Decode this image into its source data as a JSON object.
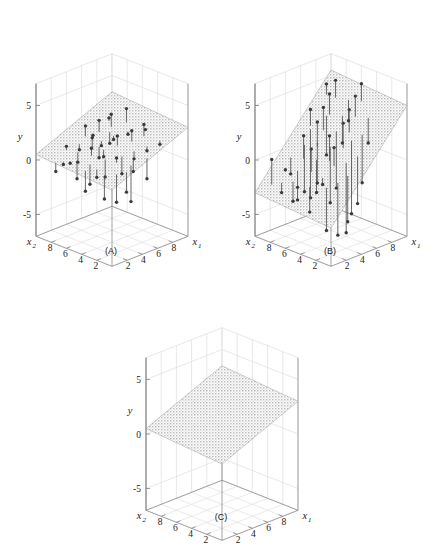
{
  "figure": {
    "type": "multi-panel-3d-regression",
    "panel_count": 3,
    "background": "#ffffff",
    "line_color": "#4d4d4d",
    "point_color": "#3a3a3a",
    "grid_color": "#d8d8d8",
    "axis_color": "#808080",
    "plane_fill": "#b9b9b9"
  },
  "axes": {
    "y_title": "y",
    "x1_title": "x",
    "x1_sub": "1",
    "x2_title": "x",
    "x2_sub": "2",
    "y_ticks": [
      "5",
      "0",
      "-5"
    ],
    "y_tick_values": [
      5,
      0,
      -5
    ],
    "x1_ticks": [
      "2",
      "4",
      "6",
      "8"
    ],
    "x1_tick_values": [
      2,
      4,
      6,
      8
    ],
    "x2_ticks": [
      "8",
      "6",
      "4",
      "2"
    ],
    "x2_tick_values": [
      8,
      6,
      4,
      2
    ],
    "y_range": [
      -7,
      7
    ],
    "x1_range": [
      0,
      10
    ],
    "x2_range": [
      0,
      10
    ]
  },
  "panels": [
    {
      "id": "A",
      "caption": "(A)",
      "description": "fitted plane with small residuals",
      "has_points": true,
      "plane_tilt": "shallow",
      "residual_scale": "short"
    },
    {
      "id": "B",
      "caption": "(B)",
      "description": "steeply tilted plane with large residuals",
      "has_points": true,
      "plane_tilt": "steep",
      "residual_scale": "long"
    },
    {
      "id": "C",
      "caption": "(C)",
      "description": "plane only, no data points",
      "has_points": false,
      "plane_tilt": "shallow",
      "residual_scale": "none"
    }
  ],
  "chart_data": {
    "type": "scatter",
    "title": "",
    "xlabel": "x1",
    "ylabel": "y",
    "zlabel": "x2",
    "grid": true,
    "legend": "none",
    "axis_ranges": {
      "x1": [
        0,
        10
      ],
      "x2": [
        0,
        10
      ],
      "y": [
        -7,
        7
      ]
    },
    "panels": [
      {
        "id": "A",
        "plane": {
          "intercept": 0.0,
          "slope_x1": 0.3,
          "slope_x2": 0.05
        },
        "points": [
          {
            "x1": 1.2,
            "x2": 8.6,
            "y": -1.0,
            "fit": -0.2
          },
          {
            "x1": 1.6,
            "x2": 8.0,
            "y": -0.3,
            "fit": -0.1
          },
          {
            "x1": 1.9,
            "x2": 7.4,
            "y": -0.1,
            "fit": 0.05
          },
          {
            "x1": 2.3,
            "x2": 6.9,
            "y": -1.5,
            "fit": 0.15
          },
          {
            "x1": 2.6,
            "x2": 5.5,
            "y": -1.7,
            "fit": 0.1
          },
          {
            "x1": 3.0,
            "x2": 9.0,
            "y": 0.7,
            "fit": 0.35
          },
          {
            "x1": 3.3,
            "x2": 7.8,
            "y": -0.5,
            "fit": 0.4
          },
          {
            "x1": 3.6,
            "x2": 6.3,
            "y": 1.1,
            "fit": 0.42
          },
          {
            "x1": 3.9,
            "x2": 4.8,
            "y": -1.2,
            "fit": 0.4
          },
          {
            "x1": 4.2,
            "x2": 8.5,
            "y": 0.2,
            "fit": 0.7
          },
          {
            "x1": 4.5,
            "x2": 7.1,
            "y": 1.6,
            "fit": 0.72
          },
          {
            "x1": 4.8,
            "x2": 5.9,
            "y": 0.1,
            "fit": 0.74
          },
          {
            "x1": 5.0,
            "x2": 3.7,
            "y": -0.9,
            "fit": 0.68
          },
          {
            "x1": 5.3,
            "x2": 8.8,
            "y": 2.0,
            "fit": 1.03
          },
          {
            "x1": 5.6,
            "x2": 7.0,
            "y": 0.6,
            "fit": 1.03
          },
          {
            "x1": 5.9,
            "x2": 5.2,
            "y": 1.9,
            "fit": 1.03
          },
          {
            "x1": 6.1,
            "x2": 3.2,
            "y": 0.3,
            "fit": 0.99
          },
          {
            "x1": 6.4,
            "x2": 8.1,
            "y": 2.4,
            "fit": 1.33
          },
          {
            "x1": 6.7,
            "x2": 6.5,
            "y": 1.0,
            "fit": 1.34
          },
          {
            "x1": 7.0,
            "x2": 4.4,
            "y": 2.3,
            "fit": 1.32
          },
          {
            "x1": 7.2,
            "x2": 2.6,
            "y": 0.9,
            "fit": 1.29
          },
          {
            "x1": 7.5,
            "x2": 7.6,
            "y": 2.8,
            "fit": 1.63
          },
          {
            "x1": 7.8,
            "x2": 5.7,
            "y": 1.4,
            "fit": 1.63
          },
          {
            "x1": 8.1,
            "x2": 3.9,
            "y": 2.7,
            "fit": 1.63
          },
          {
            "x1": 8.4,
            "x2": 2.1,
            "y": 1.3,
            "fit": 1.62
          },
          {
            "x1": 8.7,
            "x2": 6.8,
            "y": 3.2,
            "fit": 1.95
          },
          {
            "x1": 9.0,
            "x2": 4.6,
            "y": 1.8,
            "fit": 1.93
          },
          {
            "x1": 2.0,
            "x2": 3.0,
            "y": -2.2,
            "fit": -0.15
          },
          {
            "x1": 2.8,
            "x2": 2.2,
            "y": -2.5,
            "fit": 0.05
          },
          {
            "x1": 3.5,
            "x2": 1.6,
            "y": -1.6,
            "fit": 0.23
          },
          {
            "x1": 4.4,
            "x2": 1.9,
            "y": -2.8,
            "fit": 0.51
          },
          {
            "x1": 5.2,
            "x2": 2.4,
            "y": -0.4,
            "fit": 0.68
          },
          {
            "x1": 6.0,
            "x2": 1.4,
            "y": -1.0,
            "fit": 0.87
          },
          {
            "x1": 1.5,
            "x2": 5.0,
            "y": -1.9,
            "fit": -0.05
          },
          {
            "x1": 2.2,
            "x2": 4.2,
            "y": -0.6,
            "fit": 0.12
          },
          {
            "x1": 4.0,
            "x2": 3.4,
            "y": 0.9,
            "fit": 0.47
          },
          {
            "x1": 4.9,
            "x2": 6.6,
            "y": -0.2,
            "fit": 0.8
          },
          {
            "x1": 5.7,
            "x2": 8.2,
            "y": 1.2,
            "fit": 1.12
          },
          {
            "x1": 6.9,
            "x2": 7.2,
            "y": 0.4,
            "fit": 1.43
          },
          {
            "x1": 8.0,
            "x2": 8.4,
            "y": 2.1,
            "fit": 1.82
          }
        ]
      },
      {
        "id": "B",
        "plane": {
          "intercept": -3.5,
          "slope_x1": 0.85,
          "slope_x2": 0.05
        },
        "points": [
          {
            "x1": 1.0,
            "x2": 8.8,
            "y": 0.1,
            "fit": -2.2
          },
          {
            "x1": 1.4,
            "x2": 7.9,
            "y": -2.8,
            "fit": -1.9
          },
          {
            "x1": 1.8,
            "x2": 6.8,
            "y": -3.4,
            "fit": -1.6
          },
          {
            "x1": 2.2,
            "x2": 8.2,
            "y": -1.0,
            "fit": -1.2
          },
          {
            "x1": 2.6,
            "x2": 7.0,
            "y": -2.4,
            "fit": -0.9
          },
          {
            "x1": 3.0,
            "x2": 5.6,
            "y": 1.4,
            "fit": -0.7
          },
          {
            "x1": 3.3,
            "x2": 8.6,
            "y": -1.8,
            "fit": -0.3
          },
          {
            "x1": 3.6,
            "x2": 7.2,
            "y": 2.0,
            "fit": -0.1
          },
          {
            "x1": 3.9,
            "x2": 5.8,
            "y": -2.9,
            "fit": 0.1
          },
          {
            "x1": 4.2,
            "x2": 4.4,
            "y": 2.6,
            "fit": 0.3
          },
          {
            "x1": 4.5,
            "x2": 8.0,
            "y": -3.6,
            "fit": 0.7
          },
          {
            "x1": 4.8,
            "x2": 6.6,
            "y": 3.1,
            "fit": 0.9
          },
          {
            "x1": 5.1,
            "x2": 5.2,
            "y": -4.0,
            "fit": 1.1
          },
          {
            "x1": 5.4,
            "x2": 3.8,
            "y": 3.6,
            "fit": 1.3
          },
          {
            "x1": 5.7,
            "x2": 8.4,
            "y": -4.6,
            "fit": 1.7
          },
          {
            "x1": 6.0,
            "x2": 7.0,
            "y": 4.0,
            "fit": 1.9
          },
          {
            "x1": 6.3,
            "x2": 5.6,
            "y": -3.1,
            "fit": 2.1
          },
          {
            "x1": 6.6,
            "x2": 4.2,
            "y": 4.4,
            "fit": 2.3
          },
          {
            "x1": 6.9,
            "x2": 2.8,
            "y": -2.0,
            "fit": 2.4
          },
          {
            "x1": 7.2,
            "x2": 7.4,
            "y": 4.8,
            "fit": 2.9
          },
          {
            "x1": 7.5,
            "x2": 6.0,
            "y": 0.6,
            "fit": 3.1
          },
          {
            "x1": 7.8,
            "x2": 4.6,
            "y": 5.2,
            "fit": 3.3
          },
          {
            "x1": 8.1,
            "x2": 3.2,
            "y": 1.2,
            "fit": 3.5
          },
          {
            "x1": 8.4,
            "x2": 7.8,
            "y": 5.6,
            "fit": 4.0
          },
          {
            "x1": 8.7,
            "x2": 6.4,
            "y": 2.2,
            "fit": 4.1
          },
          {
            "x1": 9.0,
            "x2": 5.0,
            "y": 5.9,
            "fit": 4.3
          },
          {
            "x1": 2.4,
            "x2": 3.0,
            "y": -5.2,
            "fit": -1.3
          },
          {
            "x1": 3.1,
            "x2": 2.2,
            "y": -5.6,
            "fit": -0.8
          },
          {
            "x1": 3.8,
            "x2": 1.6,
            "y": -4.4,
            "fit": -0.2
          },
          {
            "x1": 4.6,
            "x2": 2.6,
            "y": -5.9,
            "fit": 0.5
          },
          {
            "x1": 5.3,
            "x2": 1.8,
            "y": -3.2,
            "fit": 1.1
          },
          {
            "x1": 6.1,
            "x2": 3.4,
            "y": -4.8,
            "fit": 1.9
          },
          {
            "x1": 2.0,
            "x2": 4.8,
            "y": -3.9,
            "fit": -1.6
          },
          {
            "x1": 2.9,
            "x2": 4.0,
            "y": -1.4,
            "fit": -0.8
          },
          {
            "x1": 4.0,
            "x2": 3.6,
            "y": 1.8,
            "fit": 0.1
          },
          {
            "x1": 5.0,
            "x2": 6.8,
            "y": -2.6,
            "fit": 1.1
          },
          {
            "x1": 5.9,
            "x2": 8.6,
            "y": 3.4,
            "fit": 1.9
          },
          {
            "x1": 7.0,
            "x2": 7.6,
            "y": -0.8,
            "fit": 2.8
          },
          {
            "x1": 8.3,
            "x2": 8.9,
            "y": 5.0,
            "fit": 4.0
          },
          {
            "x1": 1.6,
            "x2": 6.0,
            "y": -3.0,
            "fit": -1.9
          }
        ]
      },
      {
        "id": "C",
        "plane": {
          "intercept": 0.0,
          "slope_x1": 0.3,
          "slope_x2": 0.05
        },
        "points": []
      }
    ]
  }
}
